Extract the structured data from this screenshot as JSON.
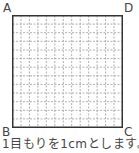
{
  "figure": {
    "vertices": {
      "A": "A",
      "B": "B",
      "C": "C",
      "D": "D"
    },
    "grid": {
      "columns": 13,
      "rows": 13,
      "unit_cm": 1
    },
    "caption": "1目もりを1cmとします。"
  },
  "colors": {
    "border": "#333333",
    "grid_line": "#999999"
  }
}
